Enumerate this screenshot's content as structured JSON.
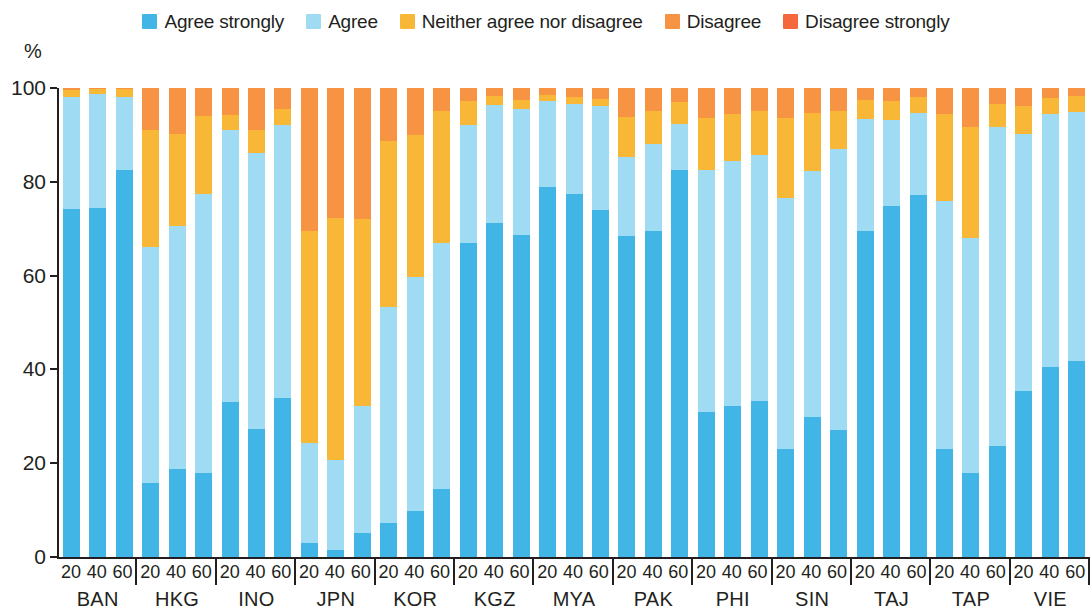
{
  "axis": {
    "y_unit_label": "%",
    "y_ticks": [
      "0",
      "20",
      "40",
      "60",
      "80",
      "100"
    ],
    "x_subticks": [
      "20",
      "40",
      "60"
    ]
  },
  "legend": {
    "items": [
      {
        "label": "Agree strongly",
        "color": "#41b6e6",
        "icon": "square-swatch"
      },
      {
        "label": "Agree",
        "color": "#9fdcf4",
        "icon": "square-swatch"
      },
      {
        "label": "Neither agree nor disagree",
        "color": "#f9b738",
        "icon": "square-swatch"
      },
      {
        "label": "Disagree",
        "color": "#f79444",
        "icon": "square-swatch"
      },
      {
        "label": "Disagree strongly",
        "color": "#f4683c",
        "icon": "square-swatch"
      }
    ]
  },
  "chart_data": {
    "type": "bar",
    "subtype": "stacked-100-percent-grouped",
    "title": "",
    "xlabel": "",
    "ylabel": "%",
    "ylim": [
      0,
      100
    ],
    "grid": false,
    "legend_position": "top-center",
    "categories": [
      "BAN",
      "HKG",
      "INO",
      "JPN",
      "KOR",
      "KGZ",
      "MYA",
      "PAK",
      "PHI",
      "SIN",
      "TAJ",
      "TAP",
      "VIE"
    ],
    "subgroups": [
      "20",
      "40",
      "60"
    ],
    "series": [
      {
        "name": "Agree strongly",
        "color": "#41b6e6"
      },
      {
        "name": "Agree",
        "color": "#9fdcf4"
      },
      {
        "name": "Neither agree nor disagree",
        "color": "#f9b738"
      },
      {
        "name": "Disagree",
        "color": "#f79444"
      },
      {
        "name": "Disagree strongly",
        "color": "#f4683c"
      }
    ],
    "bars": [
      {
        "category": "BAN",
        "subgroup": "20",
        "values": [
          74.3,
          23.7,
          1.5,
          0.5,
          0.0
        ]
      },
      {
        "category": "BAN",
        "subgroup": "40",
        "values": [
          74.4,
          24.4,
          1.0,
          0.2,
          0.0
        ]
      },
      {
        "category": "BAN",
        "subgroup": "60",
        "values": [
          82.6,
          15.5,
          1.6,
          0.3,
          0.0
        ]
      },
      {
        "category": "HKG",
        "subgroup": "20",
        "values": [
          15.8,
          50.4,
          24.9,
          8.9,
          0.0
        ]
      },
      {
        "category": "HKG",
        "subgroup": "40",
        "values": [
          18.7,
          51.8,
          19.7,
          9.8,
          0.0
        ]
      },
      {
        "category": "HKG",
        "subgroup": "60",
        "values": [
          17.9,
          59.4,
          16.7,
          6.0,
          0.0
        ]
      },
      {
        "category": "INO",
        "subgroup": "20",
        "values": [
          33.1,
          57.9,
          3.2,
          5.8,
          0.0
        ]
      },
      {
        "category": "INO",
        "subgroup": "40",
        "values": [
          27.2,
          59.0,
          4.8,
          9.0,
          0.0
        ]
      },
      {
        "category": "INO",
        "subgroup": "60",
        "values": [
          33.8,
          58.3,
          3.4,
          4.5,
          0.0
        ]
      },
      {
        "category": "JPN",
        "subgroup": "20",
        "values": [
          3.0,
          21.3,
          45.2,
          30.5,
          0.0
        ]
      },
      {
        "category": "JPN",
        "subgroup": "40",
        "values": [
          1.6,
          19.1,
          51.6,
          27.7,
          0.0
        ]
      },
      {
        "category": "JPN",
        "subgroup": "60",
        "values": [
          5.2,
          26.9,
          40.0,
          27.9,
          0.0
        ]
      },
      {
        "category": "KOR",
        "subgroup": "20",
        "values": [
          7.2,
          46.1,
          35.5,
          11.2,
          0.0
        ]
      },
      {
        "category": "KOR",
        "subgroup": "40",
        "values": [
          9.8,
          49.9,
          30.3,
          10.0,
          0.0
        ]
      },
      {
        "category": "KOR",
        "subgroup": "60",
        "values": [
          14.6,
          52.4,
          28.0,
          5.0,
          0.0
        ]
      },
      {
        "category": "KGZ",
        "subgroup": "20",
        "values": [
          67.0,
          25.1,
          5.2,
          2.7,
          0.0
        ]
      },
      {
        "category": "KGZ",
        "subgroup": "40",
        "values": [
          71.2,
          25.2,
          1.8,
          1.8,
          0.0
        ]
      },
      {
        "category": "KGZ",
        "subgroup": "60",
        "values": [
          68.7,
          26.8,
          1.9,
          2.6,
          0.0
        ]
      },
      {
        "category": "MYA",
        "subgroup": "20",
        "values": [
          78.8,
          18.5,
          1.2,
          1.5,
          0.0
        ]
      },
      {
        "category": "MYA",
        "subgroup": "40",
        "values": [
          77.5,
          19.1,
          1.5,
          1.9,
          0.0
        ]
      },
      {
        "category": "MYA",
        "subgroup": "60",
        "values": [
          74.0,
          22.2,
          1.4,
          2.4,
          0.0
        ]
      },
      {
        "category": "PAK",
        "subgroup": "20",
        "values": [
          68.4,
          16.9,
          8.5,
          6.2,
          0.0
        ]
      },
      {
        "category": "PAK",
        "subgroup": "40",
        "values": [
          69.6,
          18.4,
          7.1,
          4.9,
          0.0
        ]
      },
      {
        "category": "PAK",
        "subgroup": "60",
        "values": [
          82.5,
          9.8,
          4.7,
          3.0,
          0.0
        ]
      },
      {
        "category": "PHI",
        "subgroup": "20",
        "values": [
          30.9,
          51.6,
          11.2,
          6.3,
          0.0
        ]
      },
      {
        "category": "PHI",
        "subgroup": "40",
        "values": [
          32.1,
          52.4,
          9.9,
          5.6,
          0.0
        ]
      },
      {
        "category": "PHI",
        "subgroup": "60",
        "values": [
          33.3,
          52.5,
          9.4,
          4.8,
          0.0
        ]
      },
      {
        "category": "SIN",
        "subgroup": "20",
        "values": [
          23.0,
          53.6,
          17.1,
          6.3,
          0.0
        ]
      },
      {
        "category": "SIN",
        "subgroup": "40",
        "values": [
          29.9,
          52.4,
          12.3,
          5.4,
          0.0
        ]
      },
      {
        "category": "SIN",
        "subgroup": "60",
        "values": [
          27.1,
          59.8,
          8.2,
          4.9,
          0.0
        ]
      },
      {
        "category": "TAJ",
        "subgroup": "20",
        "values": [
          69.5,
          24.0,
          4.0,
          2.5,
          0.0
        ]
      },
      {
        "category": "TAJ",
        "subgroup": "40",
        "values": [
          74.9,
          18.2,
          4.1,
          2.8,
          0.0
        ]
      },
      {
        "category": "TAJ",
        "subgroup": "60",
        "values": [
          77.2,
          17.4,
          3.4,
          2.0,
          0.0
        ]
      },
      {
        "category": "TAP",
        "subgroup": "20",
        "values": [
          23.0,
          53.0,
          18.5,
          5.5,
          0.0
        ]
      },
      {
        "category": "TAP",
        "subgroup": "40",
        "values": [
          18.0,
          50.1,
          23.6,
          8.3,
          0.0
        ]
      },
      {
        "category": "TAP",
        "subgroup": "60",
        "values": [
          23.7,
          67.9,
          5.1,
          3.3,
          0.0
        ]
      },
      {
        "category": "VIE",
        "subgroup": "20",
        "values": [
          35.4,
          54.7,
          6.1,
          3.8,
          0.0
        ]
      },
      {
        "category": "VIE",
        "subgroup": "40",
        "values": [
          40.6,
          53.8,
          3.4,
          2.2,
          0.0
        ]
      },
      {
        "category": "VIE",
        "subgroup": "60",
        "values": [
          41.7,
          53.1,
          3.4,
          1.8,
          0.0
        ]
      }
    ]
  }
}
